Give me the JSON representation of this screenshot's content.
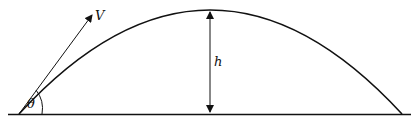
{
  "diagram": {
    "title": "",
    "labels": {
      "velocity": "V",
      "angle": "θ",
      "height": "h"
    },
    "colors": {
      "stroke": "#111111",
      "background": "#ffffff"
    }
  }
}
